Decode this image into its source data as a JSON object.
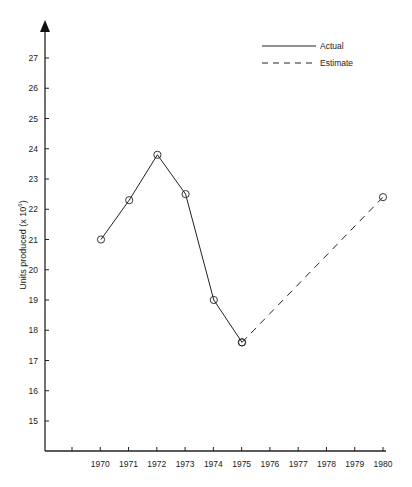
{
  "chart_data": {
    "type": "line",
    "title": "",
    "xlabel": "",
    "ylabel": "Units produced (x 10⁶)",
    "ylabel_base": "Units produced (x 10",
    "ylabel_exp": "6",
    "ylabel_close": ")",
    "x_ticks": [
      "",
      "1970",
      "1971",
      "1972",
      "1973",
      "1974",
      "1975",
      "1976",
      "1977",
      "1978",
      "1979",
      "1980"
    ],
    "y_ticks": [
      15,
      16,
      17,
      18,
      19,
      20,
      21,
      22,
      23,
      24,
      25,
      26,
      27
    ],
    "ylim": [
      14,
      28
    ],
    "grid": false,
    "legend_position": "top-right",
    "series": [
      {
        "name": "Actual",
        "style": "solid",
        "marker": "circle",
        "x": [
          1970,
          1971,
          1972,
          1973,
          1974,
          1975
        ],
        "values": [
          21.0,
          22.3,
          23.8,
          22.5,
          19.0,
          17.6
        ]
      },
      {
        "name": "Estimate",
        "style": "dashed",
        "marker": "circle",
        "x": [
          1975,
          1980
        ],
        "values": [
          17.6,
          22.4
        ]
      }
    ]
  },
  "legend": {
    "actual": "Actual",
    "estimate": "Estimate"
  },
  "colors": {
    "line": "#222222",
    "background": "#ffffff"
  }
}
